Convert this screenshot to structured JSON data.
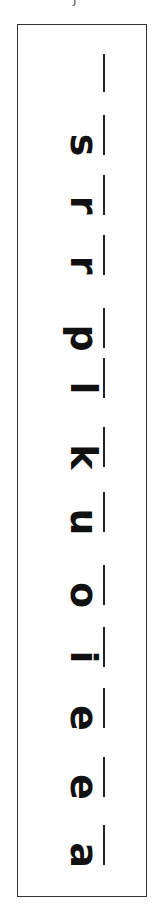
{
  "worksheet": {
    "top_mark": "J",
    "orientation": "rotated 90deg clockwise, read bottom to top",
    "letters": [
      "a",
      "e",
      "e",
      "i",
      "o",
      "u",
      "k",
      "l",
      "p",
      "r",
      "r",
      "s"
    ],
    "trailing_blank_line": true
  },
  "colors": {
    "ink": "#111111",
    "border": "#333333",
    "paper": "#ffffff"
  }
}
